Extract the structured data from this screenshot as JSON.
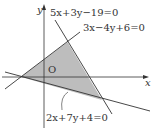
{
  "diagram": {
    "type": "coordinate-plane-inequality-region",
    "axes": {
      "x_label": "x",
      "y_label": "y",
      "origin_label": "O"
    },
    "lines": [
      {
        "id": "l1",
        "equation": "5x+3y−19=0"
      },
      {
        "id": "l2",
        "equation": "3x−4y+6=0"
      },
      {
        "id": "l3",
        "equation": "2x+7y+4=0"
      }
    ],
    "region": {
      "shaded": true,
      "vertices": [
        [
          -2,
          0
        ],
        [
          2,
          3
        ],
        [
          5,
          -2
        ]
      ]
    },
    "colors": {
      "line": "#333333",
      "shade": "#bdbdbd"
    }
  }
}
